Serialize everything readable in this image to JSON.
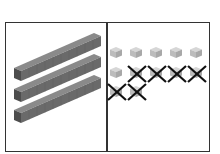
{
  "diagram": {
    "type": "base-ten-blocks-subtraction",
    "panels": [
      {
        "name": "tens",
        "rods": 3,
        "rod_color": "#6b6b6b"
      },
      {
        "name": "ones",
        "cubes_total": 12,
        "rows": [
          5,
          5,
          2
        ],
        "crossed_out": 6,
        "cube_color": "#bdbdbd",
        "cross_color": "#111111"
      }
    ]
  }
}
